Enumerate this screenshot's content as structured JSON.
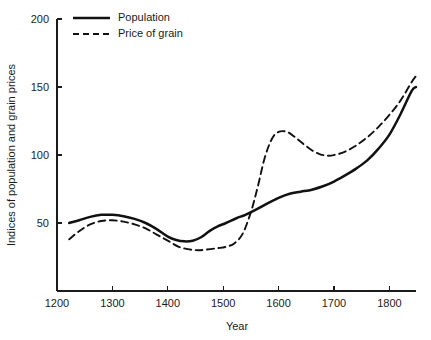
{
  "chart_data": {
    "type": "line",
    "title": "",
    "xlabel": "Year",
    "ylabel": "Indices of population and grain prices",
    "xlim": [
      1200,
      1848
    ],
    "ylim": [
      0,
      200
    ],
    "xticks": [
      1200,
      1300,
      1400,
      1500,
      1600,
      1700,
      1800
    ],
    "xtick_labels": [
      "1200",
      "1300",
      "1400",
      "1500",
      "1600",
      "1700",
      "1800"
    ],
    "yticks": [
      50,
      100,
      150,
      200
    ],
    "ytick_labels": [
      "50",
      "100",
      "150",
      "200"
    ],
    "grid": false,
    "legend_position": "top-left",
    "series": [
      {
        "name": "Population",
        "style": "solid",
        "color": "#111111",
        "x": [
          1222,
          1240,
          1260,
          1280,
          1300,
          1320,
          1340,
          1360,
          1380,
          1400,
          1415,
          1430,
          1445,
          1460,
          1475,
          1490,
          1505,
          1524,
          1540,
          1560,
          1580,
          1600,
          1620,
          1640,
          1660,
          1680,
          1700,
          1720,
          1740,
          1760,
          1780,
          1800,
          1820,
          1840,
          1848
        ],
        "y": [
          50,
          52,
          54.5,
          56,
          56,
          55,
          53,
          50,
          45.5,
          40,
          37.5,
          36.5,
          37,
          39.5,
          44,
          47.5,
          50,
          53.5,
          56,
          60,
          64.5,
          68.5,
          71.5,
          73,
          74.5,
          77,
          80.5,
          85,
          90,
          96,
          104.5,
          115,
          130,
          147,
          150
        ]
      },
      {
        "name": "Price of grain",
        "style": "dashed",
        "color": "#111111",
        "x": [
          1222,
          1240,
          1260,
          1280,
          1300,
          1320,
          1340,
          1360,
          1380,
          1400,
          1420,
          1440,
          1455,
          1470,
          1490,
          1505,
          1520,
          1535,
          1550,
          1562,
          1575,
          1588,
          1600,
          1615,
          1630,
          1645,
          1660,
          1675,
          1690,
          1705,
          1720,
          1740,
          1760,
          1780,
          1800,
          1820,
          1840,
          1848
        ],
        "y": [
          38,
          44,
          49,
          51.5,
          52,
          51,
          49,
          46,
          41.5,
          37,
          32.5,
          30.5,
          30,
          30.5,
          31.5,
          32.5,
          35,
          42,
          58,
          76,
          98,
          112,
          117,
          117,
          113,
          108,
          103.5,
          100.5,
          99.5,
          100.5,
          102.5,
          107,
          113,
          120.5,
          129.5,
          140,
          153.5,
          158
        ]
      }
    ]
  },
  "legend": {
    "items": [
      {
        "label": "Population",
        "style": "solid"
      },
      {
        "label": "Price of grain",
        "style": "dashed"
      }
    ]
  }
}
